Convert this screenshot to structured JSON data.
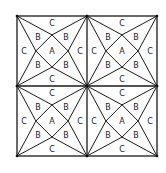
{
  "diagram": {
    "title": "",
    "colors": {
      "line": "#1a1a1a",
      "text": "#222222",
      "background": "#ffffff"
    },
    "outer": {
      "x": 17,
      "y": 16,
      "size": 140
    },
    "quadrants": [
      {
        "id": "top-left",
        "labels": {
          "center": "A",
          "inner": [
            "B",
            "B",
            "B",
            "B"
          ],
          "edges": [
            "C",
            "C",
            "C",
            "C"
          ]
        }
      },
      {
        "id": "top-right",
        "labels": {
          "center": "A",
          "inner": [
            "B",
            "B",
            "B",
            "B"
          ],
          "edges": [
            "C",
            "C",
            "C",
            "C"
          ]
        }
      },
      {
        "id": "bottom-left",
        "labels": {
          "center": "A",
          "inner": [
            "B",
            "B",
            "B",
            "B"
          ],
          "edges": [
            "C",
            "C",
            "C",
            "C"
          ]
        }
      },
      {
        "id": "bottom-right",
        "labels": {
          "center": "A",
          "inner": [
            "B",
            "B",
            "B",
            "B"
          ],
          "edges": [
            "C",
            "C",
            "C",
            "C"
          ]
        }
      }
    ]
  }
}
